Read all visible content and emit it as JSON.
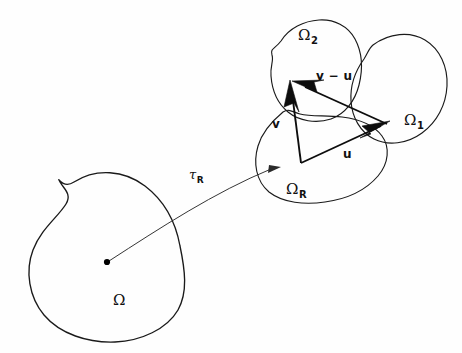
{
  "figure": {
    "background_color": "#fefefe",
    "ink_color": "#111111",
    "width": 462,
    "height": 353
  },
  "regions": [
    {
      "key": "omega",
      "base": "Ω",
      "subscript": "",
      "label_x": 113,
      "label_y": 293,
      "role": "reference-body"
    },
    {
      "key": "omega_r",
      "base": "Ω",
      "subscript": "R",
      "label_x": 286,
      "label_y": 182,
      "role": "deformed-body-R"
    },
    {
      "key": "omega_1",
      "base": "Ω",
      "subscript": "1",
      "label_x": 404,
      "label_y": 113,
      "role": "deformed-body-1"
    },
    {
      "key": "omega_2",
      "base": "Ω",
      "subscript": "2",
      "label_x": 298,
      "label_y": 28,
      "role": "deformed-body-2"
    }
  ],
  "map": {
    "key": "tau_r",
    "base": "τ",
    "subscript": "R",
    "label_x": 189,
    "label_y": 168,
    "role": "deformation-map-arrow"
  },
  "vectors": [
    {
      "key": "u",
      "label": "u",
      "label_x": 343,
      "label_y": 148,
      "role": "displacement-u"
    },
    {
      "key": "v",
      "label": "v",
      "label_x": 272,
      "label_y": 118,
      "role": "displacement-v"
    },
    {
      "key": "v_minus_u",
      "label": "v − u",
      "label_x": 316,
      "label_y": 70,
      "role": "relative-displacement"
    }
  ],
  "base_point": {
    "role": "material-point",
    "x": 107,
    "y": 262
  }
}
